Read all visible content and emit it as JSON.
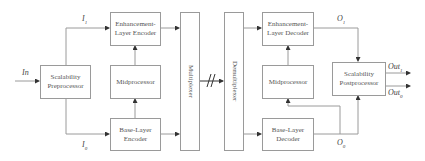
{
  "diagram": {
    "input_label": "In",
    "blocks": {
      "preprocessor": "Scalability Preprocessor",
      "enh_encoder": "Enhancement-Layer Encoder",
      "mid_encoder": "Midprocessor",
      "base_encoder": "Base-Layer Encoder",
      "multiplexer": "Multiplexer",
      "demultiplexer": "Demultiplexer",
      "enh_decoder": "Enhancement-Layer Decoder",
      "mid_decoder": "Midprocessor",
      "base_decoder": "Base-Layer Decoder",
      "postprocessor": "Scalability Postprocessor"
    },
    "signals": {
      "i1": "I",
      "i1_sub": "1",
      "i0": "I",
      "i0_sub": "0",
      "o1": "O",
      "o1_sub": "1",
      "o0": "O",
      "o0_sub": "0",
      "out1": "Out",
      "out1_sub": "1",
      "out0": "Out",
      "out0_sub": "0"
    },
    "colors": {
      "line": "#9a9a9a",
      "arrow": "#333333",
      "text": "#555555"
    }
  }
}
